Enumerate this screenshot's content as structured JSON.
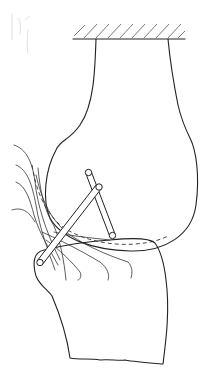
{
  "figure": {
    "elements": {
      "fixed_support": "hatched-ceiling",
      "femur": "femur-outline",
      "tibia": "tibia-outline",
      "rod_posterior": "cruciate-rod-posterior",
      "rod_anterior": "cruciate-rod-anterior",
      "ligament_fibers": "ligament-fibers",
      "dashed_path": "contact-envelope-dashed"
    },
    "colors": {
      "stroke": "#222222",
      "background": "#ffffff"
    }
  }
}
